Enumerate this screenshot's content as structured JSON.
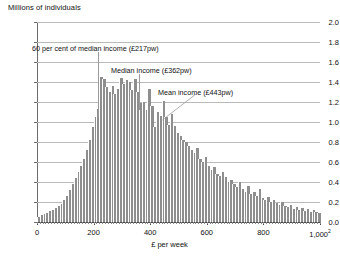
{
  "chart_data": {
    "type": "bar",
    "title": "",
    "ylabel": "Millions of individuals",
    "xlabel": "£ per week",
    "xlabel_footnote": "2",
    "ylim": [
      0,
      2.0
    ],
    "xlim": [
      0,
      1000
    ],
    "grid": true,
    "legend_position": "none",
    "y_ticks": [
      "0.0",
      "0.2",
      "0.4",
      "0.6",
      "0.8",
      "1.0",
      "1.2",
      "1.4",
      "1.6",
      "1.8",
      "2.0"
    ],
    "y_tick_values": [
      0.0,
      0.2,
      0.4,
      0.6,
      0.8,
      1.0,
      1.2,
      1.4,
      1.6,
      1.8,
      2.0
    ],
    "x_ticks": [
      "0",
      "200",
      "400",
      "600",
      "800",
      "1,000"
    ],
    "x_tick_values": [
      0,
      200,
      400,
      600,
      800,
      1000
    ],
    "bin_width": 10,
    "x": [
      5,
      15,
      25,
      35,
      45,
      55,
      65,
      75,
      85,
      95,
      105,
      115,
      125,
      135,
      145,
      155,
      165,
      175,
      185,
      195,
      205,
      215,
      225,
      235,
      245,
      255,
      265,
      275,
      285,
      295,
      305,
      315,
      325,
      335,
      345,
      355,
      365,
      375,
      385,
      395,
      405,
      415,
      425,
      435,
      445,
      455,
      465,
      475,
      485,
      495,
      505,
      515,
      525,
      535,
      545,
      555,
      565,
      575,
      585,
      595,
      605,
      615,
      625,
      635,
      645,
      655,
      665,
      675,
      685,
      695,
      705,
      715,
      725,
      735,
      745,
      755,
      765,
      775,
      785,
      795,
      805,
      815,
      825,
      835,
      845,
      855,
      865,
      875,
      885,
      895,
      905,
      915,
      925,
      935,
      945,
      955,
      965,
      975,
      985,
      995
    ],
    "values": [
      0.05,
      0.07,
      0.08,
      0.09,
      0.11,
      0.12,
      0.14,
      0.16,
      0.18,
      0.22,
      0.26,
      0.32,
      0.38,
      0.44,
      0.5,
      0.56,
      0.63,
      0.72,
      0.82,
      0.95,
      1.05,
      1.13,
      1.45,
      1.43,
      1.35,
      1.3,
      1.36,
      1.28,
      1.33,
      1.44,
      1.38,
      1.42,
      1.4,
      1.32,
      1.43,
      1.3,
      1.19,
      1.2,
      1.12,
      1.33,
      1.16,
      0.95,
      1.1,
      1.06,
      1.21,
      1.05,
      0.97,
      1.08,
      0.96,
      0.89,
      0.86,
      0.82,
      0.8,
      0.76,
      0.72,
      0.69,
      0.74,
      0.63,
      0.6,
      0.65,
      0.56,
      0.52,
      0.55,
      0.48,
      0.46,
      0.5,
      0.45,
      0.4,
      0.42,
      0.38,
      0.35,
      0.4,
      0.33,
      0.3,
      0.36,
      0.28,
      0.3,
      0.26,
      0.33,
      0.24,
      0.22,
      0.25,
      0.2,
      0.22,
      0.19,
      0.17,
      0.2,
      0.16,
      0.15,
      0.17,
      0.13,
      0.15,
      0.12,
      0.14,
      0.11,
      0.13,
      0.1,
      0.12,
      0.1,
      0.09
    ],
    "annotations": [
      {
        "label": "60 per cent of median income (£217pw)",
        "value": 217,
        "type": "vertical-line"
      },
      {
        "label": "Median income (£362pw)",
        "value": 362,
        "type": "vertical-line"
      },
      {
        "label": "Mean income (£443pw)",
        "value": 443,
        "type": "diagonal-leader"
      }
    ]
  }
}
